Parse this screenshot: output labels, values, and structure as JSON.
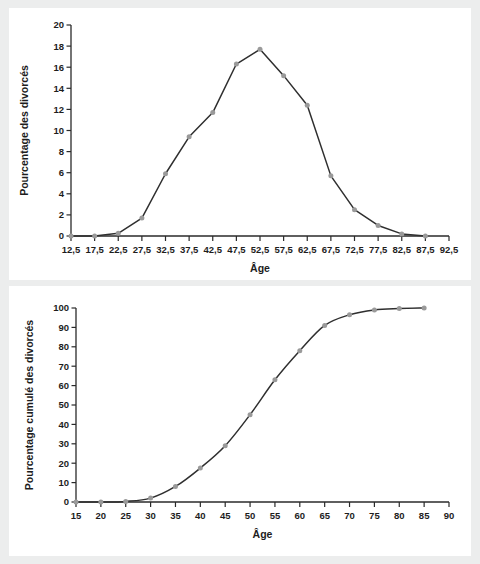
{
  "page": {
    "background_color": "#eceded",
    "panel_color": "#ffffff",
    "line_color": "#2f2f2f",
    "marker_color": "#9a9a9a",
    "axis_color": "#2a2a2a"
  },
  "chart_data": [
    {
      "id": "divorce-distribution",
      "type": "line",
      "title": "",
      "xlabel": "Âge",
      "ylabel": "Pourcentage des divorcés",
      "xlim": [
        12.5,
        92.5
      ],
      "ylim": [
        0,
        20
      ],
      "grid": false,
      "legend": "none",
      "xticks": [
        12.5,
        17.5,
        22.5,
        27.5,
        32.5,
        37.5,
        42.5,
        47.5,
        52.5,
        57.5,
        62.5,
        67.5,
        72.5,
        77.5,
        82.5,
        87.5,
        92.5
      ],
      "xticklabels": [
        "12,5",
        "17,5",
        "22,5",
        "27,5",
        "32,5",
        "37,5",
        "42,5",
        "47,5",
        "52,5",
        "57,5",
        "62,5",
        "67,5",
        "72,5",
        "77,5",
        "82,5",
        "87,5",
        "92,5"
      ],
      "yticks": [
        0,
        2,
        4,
        6,
        8,
        10,
        12,
        14,
        16,
        18,
        20
      ],
      "yticklabels": [
        "0",
        "2",
        "4",
        "6",
        "8",
        "10",
        "12",
        "14",
        "16",
        "18",
        "20"
      ],
      "x": [
        12.5,
        17.5,
        22.5,
        27.5,
        32.5,
        37.5,
        42.5,
        47.5,
        52.5,
        57.5,
        62.5,
        67.5,
        72.5,
        77.5,
        82.5,
        87.5
      ],
      "values": [
        0.0,
        0.0,
        0.25,
        1.7,
        5.9,
        9.4,
        11.7,
        16.3,
        17.7,
        15.2,
        12.4,
        5.7,
        2.5,
        1.0,
        0.2,
        0.0
      ]
    },
    {
      "id": "divorce-cumulative",
      "type": "line",
      "title": "",
      "xlabel": "Âge",
      "ylabel": "Pourcentage cumulé des divorcés",
      "xlim": [
        15,
        90
      ],
      "ylim": [
        0,
        100
      ],
      "grid": false,
      "legend": "none",
      "xticks": [
        15,
        20,
        25,
        30,
        35,
        40,
        45,
        50,
        55,
        60,
        65,
        70,
        75,
        80,
        85,
        90
      ],
      "xticklabels": [
        "15",
        "20",
        "25",
        "30",
        "35",
        "40",
        "45",
        "50",
        "55",
        "60",
        "65",
        "70",
        "75",
        "80",
        "85",
        "90"
      ],
      "yticks": [
        0,
        10,
        20,
        30,
        40,
        50,
        60,
        70,
        80,
        90,
        100
      ],
      "yticklabels": [
        "0",
        "10",
        "20",
        "30",
        "40",
        "50",
        "60",
        "70",
        "80",
        "90",
        "100"
      ],
      "x": [
        15,
        20,
        25,
        30,
        35,
        40,
        45,
        50,
        55,
        60,
        65,
        70,
        75,
        80,
        85
      ],
      "values": [
        0.0,
        0.0,
        0.3,
        2.0,
        8.0,
        17.5,
        29.0,
        45.0,
        63.0,
        78.0,
        91.0,
        96.5,
        99.0,
        99.7,
        100.0
      ]
    }
  ]
}
